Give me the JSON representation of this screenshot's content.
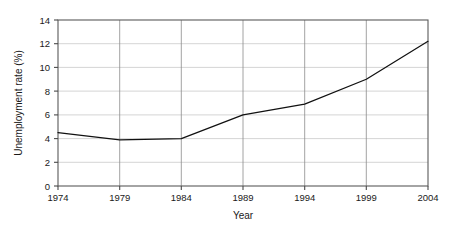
{
  "chart_data": {
    "type": "line",
    "title": "",
    "xlabel": "Year",
    "ylabel": "Unemployment rate (%)",
    "x": [
      1974,
      1979,
      1984,
      1989,
      1994,
      1999,
      2004
    ],
    "values": [
      4.5,
      3.9,
      4.0,
      6.0,
      6.9,
      9.0,
      12.2
    ],
    "series": [
      {
        "name": "Unemployment rate",
        "values": [
          4.5,
          3.9,
          4.0,
          6.0,
          6.9,
          9.0,
          12.2
        ]
      }
    ],
    "xlim": [
      1974,
      2004
    ],
    "ylim": [
      0,
      14
    ],
    "xticks": [
      1974,
      1979,
      1984,
      1989,
      1994,
      1999,
      2004
    ],
    "yticks": [
      0,
      2,
      4,
      6,
      8,
      10,
      12,
      14
    ],
    "xtick_labels": [
      "1974",
      "1979",
      "1984",
      "1989",
      "1994",
      "1999",
      "2004"
    ],
    "ytick_labels": [
      "0",
      "2",
      "4",
      "6",
      "8",
      "10",
      "12",
      "14"
    ],
    "grid": true,
    "grid_horizontal": true,
    "grid_vertical": true,
    "legend": false,
    "legend_position": "none",
    "line_color": "#111111",
    "grid_color_horizontal": "#c9c9c9",
    "grid_color_vertical": "#8a8a8a",
    "frame_color": "#5a5a5a",
    "background_color": "#ffffff"
  },
  "axes": {
    "y_title": "Unemployment rate (%)",
    "x_title": "Year",
    "y_ticks": [
      {
        "label": "14",
        "value": 14
      },
      {
        "label": "12",
        "value": 12
      },
      {
        "label": "10",
        "value": 10
      },
      {
        "label": "8",
        "value": 8
      },
      {
        "label": "6",
        "value": 6
      },
      {
        "label": "4",
        "value": 4
      },
      {
        "label": "2",
        "value": 2
      },
      {
        "label": "0",
        "value": 0
      }
    ],
    "x_ticks": [
      {
        "label": "1974",
        "value": 1974
      },
      {
        "label": "1979",
        "value": 1979
      },
      {
        "label": "1984",
        "value": 1984
      },
      {
        "label": "1989",
        "value": 1989
      },
      {
        "label": "1994",
        "value": 1994
      },
      {
        "label": "1999",
        "value": 1999
      },
      {
        "label": "2004",
        "value": 2004
      }
    ]
  }
}
